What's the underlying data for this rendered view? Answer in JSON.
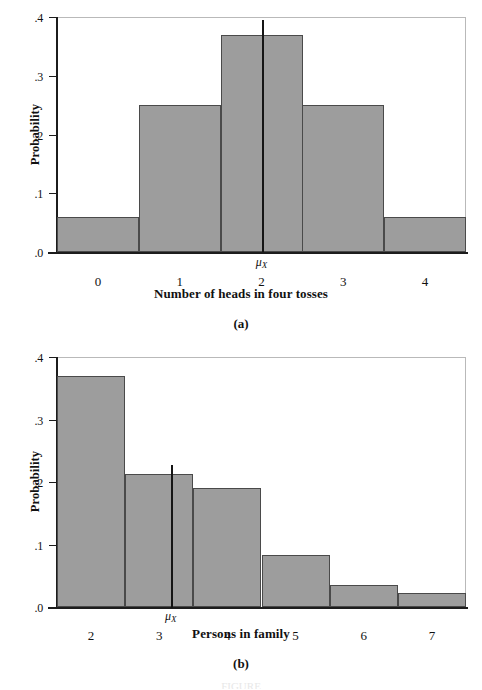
{
  "chart_data": [
    {
      "type": "bar",
      "panel": "(a)",
      "title": "",
      "xlabel": "Number of heads in four tosses",
      "ylabel": "Probability",
      "categories": [
        "0",
        "1",
        "2",
        "3",
        "4"
      ],
      "values": [
        0.06,
        0.25,
        0.37,
        0.25,
        0.06
      ],
      "ylim": [
        0.0,
        0.4
      ],
      "xlim": [
        -0.5,
        4.5
      ],
      "ytick_labels": [
        ".4",
        ".3",
        ".2",
        ".1",
        ".0"
      ],
      "ytick_values": [
        0.4,
        0.3,
        0.2,
        0.1,
        0.0
      ],
      "grid": false,
      "legend": "none",
      "annotations": [
        {
          "name": "mean-marker",
          "label": "μ",
          "subscript": "X",
          "x": 2.0,
          "y_top": 0.395
        }
      ]
    },
    {
      "type": "bar",
      "panel": "(b)",
      "title": "",
      "xlabel": "Persons in family",
      "ylabel": "Probability",
      "categories": [
        "2",
        "3",
        "4",
        "5",
        "6",
        "7"
      ],
      "values": [
        0.37,
        0.213,
        0.19,
        0.083,
        0.035,
        0.023
      ],
      "ylim": [
        0.0,
        0.4
      ],
      "xlim": [
        1.5,
        7.5
      ],
      "ytick_labels": [
        ".4",
        ".3",
        ".2",
        ".1",
        ".0"
      ],
      "ytick_values": [
        0.4,
        0.3,
        0.2,
        0.1,
        0.0
      ],
      "grid": false,
      "legend": "none",
      "annotations": [
        {
          "name": "mean-marker",
          "label": "μ",
          "subscript": "X",
          "x": 3.17,
          "y_top": 0.228
        }
      ]
    }
  ],
  "figure": {
    "panel_a": {
      "caption": "(a)",
      "xlabel": "Number of heads in four tosses",
      "ylabel": "Probability",
      "ytick_labels": [
        ".4",
        ".3",
        ".2",
        ".1",
        ".0"
      ],
      "xtick_labels": [
        "0",
        "1",
        "2",
        "3",
        "4"
      ],
      "mu_label": "μ",
      "mu_subscript": "X"
    },
    "panel_b": {
      "caption": "(b)",
      "xlabel": "Persons in family",
      "ylabel": "Probability",
      "ytick_labels": [
        ".4",
        ".3",
        ".2",
        ".1",
        ".0"
      ],
      "xtick_labels": [
        "2",
        "3",
        "4",
        "5",
        "6",
        "7"
      ],
      "mu_label": "μ",
      "mu_subscript": "X"
    },
    "footer_text": "FIGURE"
  },
  "colors": {
    "bar_fill": "#9d9d9d",
    "bar_edge": "#4a4a4a",
    "axis": "#1c1c1c",
    "frame": "#b9b9b9",
    "text": "#111111"
  }
}
